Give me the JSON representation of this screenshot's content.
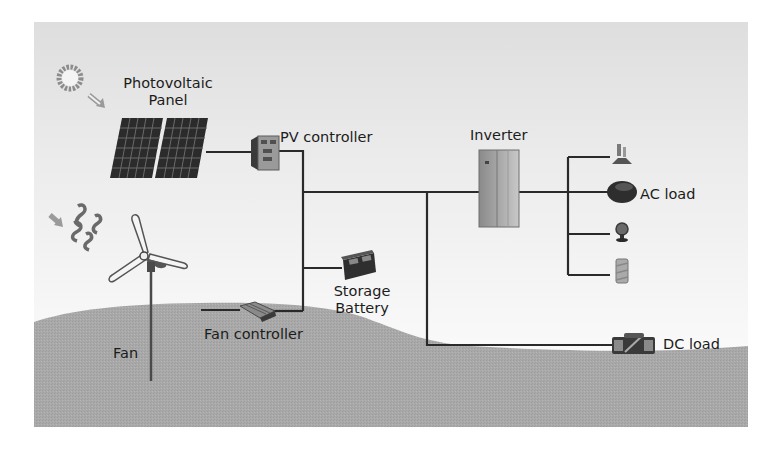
{
  "diagram": {
    "type": "wind-solar hybrid power system",
    "colors": {
      "sky": "#ebebeb",
      "ground": "#a8a8a8",
      "wire": "#2a2a2a",
      "panel": "#2b2b2b",
      "label": "#1c1c1c"
    },
    "nodes": {
      "sun": {
        "icon": "sun-icon"
      },
      "wind": {
        "icon": "wind-swirl-icon"
      },
      "pv_panel": {
        "label_line1": "Photovoltaic",
        "label_line2": "Panel",
        "icon": "solar-panel-icon"
      },
      "pv_controller": {
        "label": "PV controller",
        "icon": "controller-box-icon"
      },
      "inverter": {
        "label": "Inverter",
        "icon": "inverter-cabinet-icon"
      },
      "ac_load": {
        "label": "AC load",
        "icons": [
          "lamp-icon",
          "rice-cooker-icon",
          "fan-appliance-icon",
          "heater-icon"
        ]
      },
      "storage_battery": {
        "label_line1": "Storage",
        "label_line2": "Battery",
        "icon": "battery-icon"
      },
      "fan": {
        "label": "Fan",
        "icon": "wind-turbine-icon"
      },
      "fan_controller": {
        "label": "Fan controller",
        "icon": "fan-controller-icon"
      },
      "dc_load": {
        "label": "DC load",
        "icon": "dc-appliance-icon"
      }
    },
    "edges": [
      [
        "pv_panel",
        "pv_controller"
      ],
      [
        "pv_controller",
        "dc_bus"
      ],
      [
        "fan",
        "fan_controller"
      ],
      [
        "fan_controller",
        "dc_bus"
      ],
      [
        "dc_bus",
        "storage_battery"
      ],
      [
        "dc_bus",
        "inverter"
      ],
      [
        "dc_bus",
        "dc_load"
      ],
      [
        "inverter",
        "ac_load"
      ]
    ]
  }
}
